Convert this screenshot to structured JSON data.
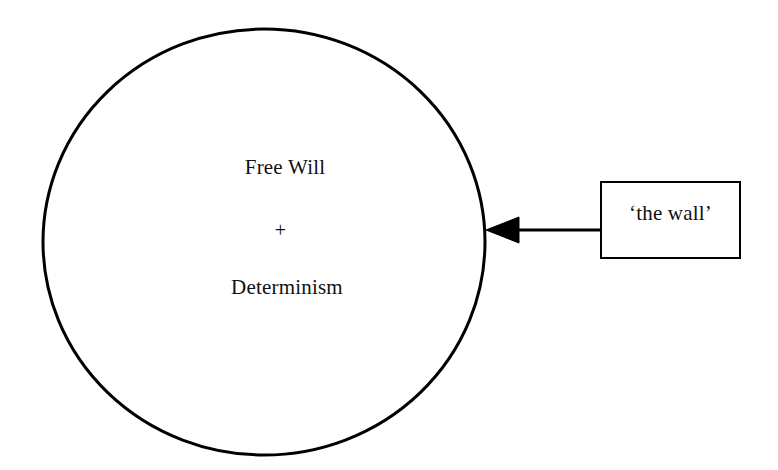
{
  "diagram": {
    "background_color": "#ffffff",
    "stroke_color": "#000000",
    "text_color": "#111111",
    "circle": {
      "name": "free-will-determinism-circle",
      "center_x": 264,
      "center_y": 242,
      "radius_x": 221,
      "radius_y": 213,
      "stroke_width": 3,
      "fill": "none"
    },
    "circle_labels": {
      "top": "Free Will",
      "operator": "+",
      "bottom": "Determinism"
    },
    "callout_box": {
      "name": "the-wall-box",
      "label": "‘the wall’",
      "x": 601,
      "y": 182,
      "width": 139,
      "height": 76,
      "stroke_width": 2,
      "fill": "#ffffff"
    },
    "connector": {
      "name": "wall-arrow",
      "from_x": 601,
      "to_x": 486,
      "y": 230,
      "stroke_width": 3,
      "arrowhead": "filled-triangle-left",
      "arrowhead_length": 33,
      "arrowhead_half_height": 13
    }
  }
}
